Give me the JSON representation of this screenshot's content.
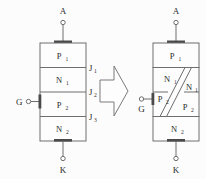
{
  "figure": {
    "colors": {
      "line": "#6e6e6e",
      "contact": "#4a4a4a",
      "background": "#fcfcfc",
      "text": "#2b2b2b"
    }
  },
  "left_device": {
    "name": "four-layer-thyristor-structure",
    "terminals": {
      "anode": "A",
      "gate": "G",
      "cathode": "K"
    },
    "layers": [
      {
        "base": "P",
        "sub": "1"
      },
      {
        "base": "N",
        "sub": "1"
      },
      {
        "base": "P",
        "sub": "2"
      },
      {
        "base": "N",
        "sub": "2"
      }
    ],
    "junctions": [
      {
        "base": "J",
        "sub": "1"
      },
      {
        "base": "J",
        "sub": "2"
      },
      {
        "base": "J",
        "sub": "3"
      }
    ]
  },
  "arrow": {
    "name": "transform-arrow",
    "direction": "right"
  },
  "right_device": {
    "name": "split-two-transistor-structure",
    "terminals": {
      "anode": "A",
      "gate": "G",
      "cathode": "K"
    },
    "layers": [
      {
        "base": "P",
        "sub": "1"
      },
      {
        "base": "N",
        "sub": "1"
      },
      {
        "base": "N",
        "sub": "1"
      },
      {
        "base": "P",
        "sub": "2"
      },
      {
        "base": "P",
        "sub": "2"
      },
      {
        "base": "N",
        "sub": "2"
      }
    ]
  }
}
